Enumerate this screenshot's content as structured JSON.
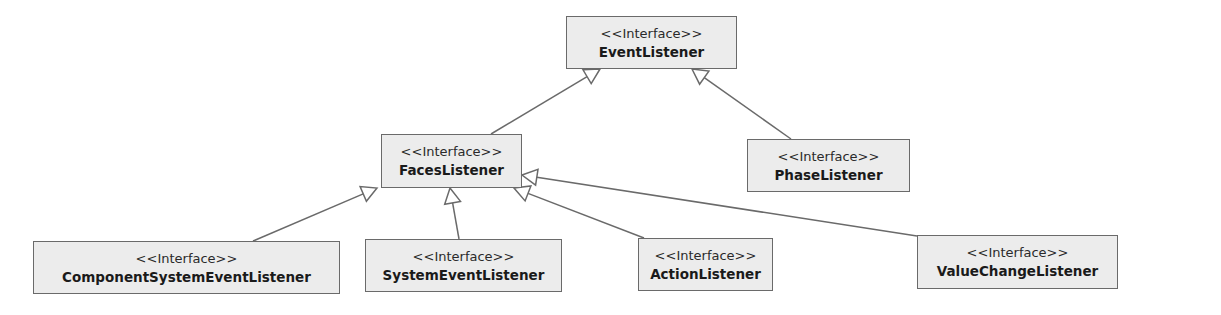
{
  "diagram": {
    "type": "uml-class-diagram",
    "colors": {
      "background": "#ffffff",
      "box_fill": "#ececec",
      "box_border": "#6a6a6a",
      "edge": "#6a6a6a"
    },
    "nodes": [
      {
        "id": "EventListener",
        "stereotype": "<<Interface>>",
        "name": "EventListener",
        "x": 566,
        "y": 16,
        "w": 171,
        "h": 53
      },
      {
        "id": "FacesListener",
        "stereotype": "<<Interface>>",
        "name": "FacesListener",
        "x": 381,
        "y": 134,
        "w": 141,
        "h": 54
      },
      {
        "id": "PhaseListener",
        "stereotype": "<<Interface>>",
        "name": "PhaseListener",
        "x": 747,
        "y": 139,
        "w": 163,
        "h": 53
      },
      {
        "id": "ComponentSystemEventListener",
        "stereotype": "<<Interface>>",
        "name": "ComponentSystemEventListener",
        "x": 33,
        "y": 241,
        "w": 307,
        "h": 53
      },
      {
        "id": "SystemEventListener",
        "stereotype": "<<Interface>>",
        "name": "SystemEventListener",
        "x": 365,
        "y": 239,
        "w": 197,
        "h": 53
      },
      {
        "id": "ActionListener",
        "stereotype": "<<Interface>>",
        "name": "ActionListener",
        "x": 638,
        "y": 238,
        "w": 135,
        "h": 53
      },
      {
        "id": "ValueChangeListener",
        "stereotype": "<<Interface>>",
        "name": "ValueChangeListener",
        "x": 917,
        "y": 235,
        "w": 201,
        "h": 54
      }
    ],
    "edges": [
      {
        "from": "FacesListener",
        "to": "EventListener",
        "kind": "generalization",
        "x1": 491,
        "y1": 134,
        "x2": 600,
        "y2": 69
      },
      {
        "from": "PhaseListener",
        "to": "EventListener",
        "kind": "generalization",
        "x1": 791,
        "y1": 139,
        "x2": 692,
        "y2": 69
      },
      {
        "from": "ComponentSystemEventListener",
        "to": "FacesListener",
        "kind": "generalization",
        "x1": 253,
        "y1": 241,
        "x2": 377,
        "y2": 188
      },
      {
        "from": "SystemEventListener",
        "to": "FacesListener",
        "kind": "generalization",
        "x1": 459,
        "y1": 239,
        "x2": 450,
        "y2": 188
      },
      {
        "from": "ActionListener",
        "to": "FacesListener",
        "kind": "generalization",
        "x1": 644,
        "y1": 238,
        "x2": 514,
        "y2": 188
      },
      {
        "from": "ValueChangeListener",
        "to": "FacesListener",
        "kind": "generalization",
        "x1": 917,
        "y1": 236,
        "x2": 522,
        "y2": 175
      }
    ]
  }
}
